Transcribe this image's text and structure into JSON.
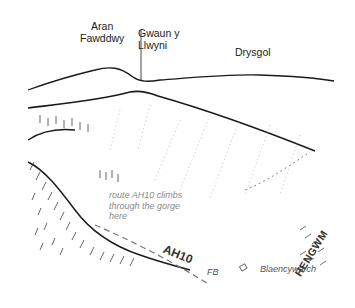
{
  "illustration": {
    "type": "sketched landscape panorama",
    "peaks": [
      {
        "name": "Aran Fawddwy",
        "lines": [
          "Aran",
          "Fawddwy"
        ]
      },
      {
        "name": "Gwaun y Llwyni",
        "lines": [
          "Gwaun y",
          "Llwyni"
        ]
      },
      {
        "name": "Drysgol",
        "lines": [
          "Drysgol"
        ]
      }
    ],
    "annotation": {
      "lines": [
        "route AH10 climbs",
        "through the gorge",
        "here"
      ]
    },
    "route_label": "AH10",
    "valley_label": "HENGWM",
    "footbridge_label": "FB",
    "settlement_label": "Blaencywarch",
    "colors": {
      "ink": "#1a1a1a",
      "annotation": "#8a8a8a",
      "background": "#ffffff"
    }
  }
}
